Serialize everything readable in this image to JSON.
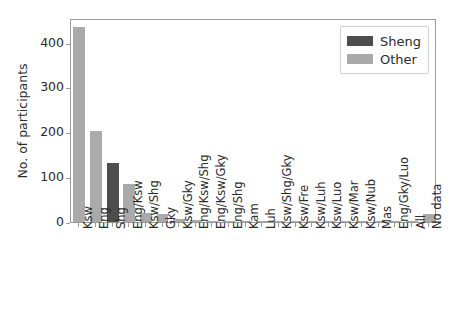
{
  "chart_data": {
    "type": "bar",
    "title": "",
    "xlabel": "",
    "ylabel": "No. of participants",
    "ylim": [
      0,
      455
    ],
    "yticks": [
      0,
      100,
      200,
      300,
      400
    ],
    "ytick_labels": [
      "0",
      "100",
      "200",
      "300",
      "400"
    ],
    "grid": false,
    "legend_position": "upper right",
    "categories": [
      "Ksw",
      "Eng",
      "Shg",
      "Eng/Ksw",
      "Ksw/Shg",
      "Gky",
      "Ksw/Gky",
      "Eng/Ksw/Shg",
      "Eng/Ksw/Gky",
      "Eng/Shg",
      "Kam",
      "Luh",
      "Ksw/Shg/Gky",
      "Ksw/Fre",
      "Ksw/Luh",
      "Ksw/Luo",
      "Ksw/Mar",
      "Ksw/Nub",
      "Mas",
      "Eng/Gky/Luo",
      "All",
      "No data"
    ],
    "values": [
      436,
      204,
      131,
      84,
      19,
      17,
      6,
      4,
      3,
      2,
      2,
      2,
      2,
      1,
      1,
      1,
      1,
      1,
      1,
      1,
      1,
      17
    ],
    "group_of_bar": [
      "Other",
      "Other",
      "Sheng",
      "Other",
      "Other",
      "Other",
      "Other",
      "Other",
      "Other",
      "Other",
      "Other",
      "Other",
      "Other",
      "Other",
      "Other",
      "Other",
      "Other",
      "Other",
      "Other",
      "Other",
      "Other",
      "Other"
    ],
    "legend": [
      {
        "label": "Sheng",
        "color": "#4d4d4d"
      },
      {
        "label": "Other",
        "color": "#aaaaaa"
      }
    ],
    "colors": {
      "sheng": "#4d4d4d",
      "other": "#aaaaaa",
      "axis": "#9a9a9a",
      "text": "#2b2b2b",
      "background": "#ffffff"
    }
  }
}
